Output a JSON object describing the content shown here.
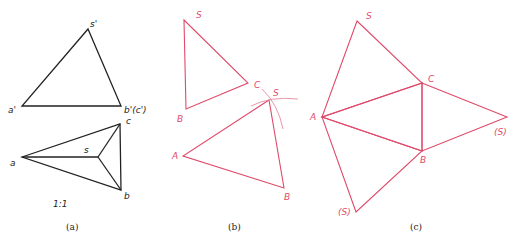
{
  "colors": {
    "background": "#ffffff",
    "projection_lines": "#222222",
    "development_lines": "#e04a6a",
    "construction_arcs": "#e88aa0"
  },
  "panel_a": {
    "caption": "(a)",
    "scale_label": "1:1",
    "front_view": {
      "labels": {
        "s_prime": "s'",
        "a_prime": "a'",
        "b_prime_c_prime": "b'(c')"
      }
    },
    "top_view": {
      "labels": {
        "a": "a",
        "b": "b",
        "c": "c",
        "s": "s"
      }
    }
  },
  "panel_b": {
    "caption": "(b)",
    "upper_triangle": {
      "labels": {
        "S": "S",
        "B": "B",
        "C": "C"
      }
    },
    "lower_triangle": {
      "labels": {
        "S": "S",
        "A": "A",
        "B": "B"
      }
    }
  },
  "panel_c": {
    "caption": "(c)",
    "labels": {
      "S_top": "S",
      "C": "C",
      "A": "A",
      "B": "B",
      "S_right": "(S)",
      "S_bottom": "(S)"
    }
  }
}
